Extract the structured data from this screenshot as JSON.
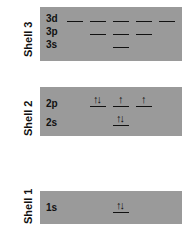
{
  "shells": [
    {
      "label": "Shell 3",
      "subshells": [
        {
          "name": "3d",
          "orbitals": 5,
          "electrons": [
            "",
            "",
            "",
            "",
            ""
          ]
        },
        {
          "name": "3p",
          "orbitals": 3,
          "electrons": [
            "",
            "",
            ""
          ]
        },
        {
          "name": "3s",
          "orbitals": 1,
          "electrons": [
            ""
          ]
        }
      ]
    },
    {
      "label": "Shell 2",
      "subshells": [
        {
          "name": "2p",
          "orbitals": 3,
          "electrons": [
            "↑↓",
            "↑",
            "↑"
          ]
        },
        {
          "name": "2s",
          "orbitals": 1,
          "electrons": [
            "↑↓"
          ]
        }
      ]
    },
    {
      "label": "Shell 1",
      "subshells": [
        {
          "name": "1s",
          "orbitals": 1,
          "electrons": [
            "↑↓"
          ]
        }
      ]
    }
  ],
  "colors": {
    "box": "#9a9a9a",
    "line": "#111111"
  }
}
